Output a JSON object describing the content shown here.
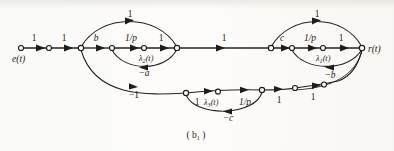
{
  "figure": {
    "caption": "( b",
    "caption_sub": "1",
    "caption_end": " )",
    "domain_kind": "signal-flow-graph"
  },
  "nodes": {
    "source_label": "e(t)",
    "sink_label": "r(t)",
    "n_b": "b",
    "n_c": "c"
  },
  "labels": {
    "top_arc_left": "1",
    "top_arc_right": "1",
    "e_seg1": "1",
    "e_seg2": "1",
    "b_branch": "b",
    "inv_p_left": "1/p",
    "one_after_p_left": "1",
    "lambda2": "λ",
    "lambda2_sub": "2",
    "lambda2_arg": "(t)",
    "minus_a": "−a",
    "mid_long": "1",
    "c_branch": "c",
    "inv_p_right": "1/p",
    "one_after_p_right": "1",
    "lambda1": "λ",
    "lambda1_sub": "1",
    "lambda1_arg": "(t)",
    "minus_b": "−b",
    "minus_one": "−1",
    "bot_one_a": "1",
    "lambda3": "λ",
    "lambda3_sub": "3",
    "lambda3_arg": "(t)",
    "inv_p_bottom": "1/p",
    "minus_c": "−c",
    "bot_one_b": "1",
    "bot_one_c": "1"
  },
  "colors": {
    "ink": "#26221f",
    "paper": "#fdfdfb",
    "node_fill": "#fdfdfb"
  }
}
